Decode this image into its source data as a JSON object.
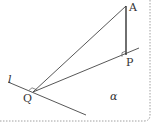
{
  "diagram": {
    "type": "solid-geometry",
    "points": {
      "A": "A",
      "P": "P",
      "Q": "Q"
    },
    "line_label": "l",
    "plane_label": "α",
    "segments": [
      "AP",
      "AQ",
      "PQ"
    ],
    "right_angles": [
      "APQ-foot at P",
      "at Q between l and QP"
    ],
    "colors": {
      "stroke": "#444444",
      "text": "#333333",
      "border": "#888888"
    }
  }
}
